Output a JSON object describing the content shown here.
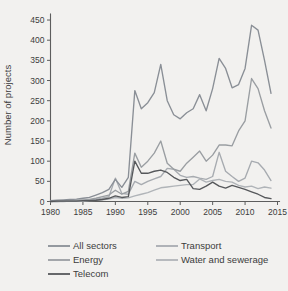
{
  "chart_data": {
    "type": "line",
    "title": "",
    "xlabel": "",
    "ylabel": "Number of projects",
    "xlim": [
      1980,
      2015
    ],
    "ylim": [
      0,
      460
    ],
    "xticks": [
      1980,
      1985,
      1990,
      1995,
      2000,
      2005,
      2010,
      2015
    ],
    "yticks": [
      0,
      50,
      100,
      150,
      200,
      250,
      300,
      350,
      400,
      450
    ],
    "grid": false,
    "legend_position": "bottom",
    "x": [
      1980,
      1981,
      1982,
      1983,
      1984,
      1985,
      1986,
      1987,
      1988,
      1989,
      1990,
      1991,
      1992,
      1993,
      1994,
      1995,
      1996,
      1997,
      1998,
      1999,
      2000,
      2001,
      2002,
      2003,
      2004,
      2005,
      2006,
      2007,
      2008,
      2009,
      2010,
      2011,
      2012,
      2013,
      2014
    ],
    "series": [
      {
        "name": "All sectors",
        "color": "#8a8f96",
        "values": [
          2,
          3,
          4,
          5,
          6,
          8,
          10,
          16,
          22,
          30,
          55,
          35,
          60,
          275,
          230,
          245,
          270,
          340,
          250,
          215,
          205,
          220,
          230,
          265,
          225,
          280,
          355,
          330,
          282,
          290,
          330,
          437,
          425,
          350,
          268
        ]
      },
      {
        "name": "Energy",
        "color": "#9a9ea2",
        "values": [
          1,
          1,
          2,
          2,
          3,
          4,
          5,
          8,
          12,
          16,
          28,
          18,
          25,
          120,
          85,
          100,
          120,
          150,
          95,
          80,
          75,
          95,
          110,
          125,
          100,
          115,
          140,
          140,
          138,
          175,
          200,
          305,
          280,
          225,
          182
        ]
      },
      {
        "name": "Telecom",
        "color": "#56585b",
        "values": [
          0,
          1,
          1,
          1,
          1,
          2,
          2,
          3,
          5,
          8,
          14,
          10,
          12,
          100,
          70,
          70,
          75,
          78,
          72,
          60,
          52,
          55,
          32,
          30,
          38,
          48,
          38,
          33,
          40,
          35,
          30,
          24,
          18,
          10,
          7
        ]
      },
      {
        "name": "Transport",
        "color": "#a7abb0",
        "values": [
          0,
          0,
          1,
          1,
          1,
          2,
          3,
          5,
          8,
          12,
          58,
          20,
          18,
          50,
          42,
          50,
          56,
          62,
          82,
          80,
          65,
          60,
          62,
          58,
          55,
          62,
          122,
          75,
          62,
          50,
          58,
          100,
          96,
          78,
          52
        ]
      },
      {
        "name": "Water and sewerage",
        "color": "#b0b4b8",
        "values": [
          0,
          0,
          0,
          1,
          1,
          1,
          2,
          3,
          4,
          6,
          10,
          8,
          9,
          14,
          18,
          22,
          28,
          34,
          36,
          38,
          40,
          42,
          42,
          56,
          48,
          52,
          55,
          50,
          48,
          40,
          36,
          38,
          32,
          36,
          33
        ]
      }
    ]
  },
  "legend": {
    "entries": [
      {
        "label": "All sectors",
        "color": "#8a8f96"
      },
      {
        "label": "Energy",
        "color": "#9a9ea2"
      },
      {
        "label": "Telecom",
        "color": "#56585b"
      },
      {
        "label": "Transport",
        "color": "#a7abb0"
      },
      {
        "label": "Water and sewerage",
        "color": "#b0b4b8"
      }
    ]
  },
  "axes": {
    "y_title": "Number of projects",
    "y_tick_labels": [
      "0",
      "50",
      "100",
      "150",
      "200",
      "250",
      "300",
      "350",
      "400",
      "450"
    ],
    "x_tick_labels": [
      "1980",
      "1985",
      "1990",
      "1995",
      "2000",
      "2005",
      "2010",
      "2015"
    ]
  }
}
